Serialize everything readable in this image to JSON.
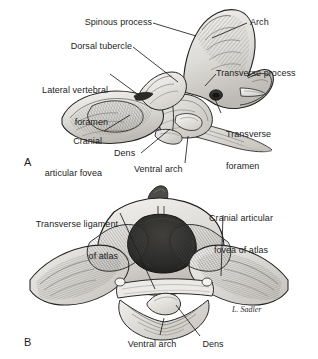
{
  "figure": {
    "background_color": "#ffffff",
    "ink_color": "#1d1d1d",
    "signature": "L. Sadler"
  },
  "panels": [
    {
      "letter": "A",
      "view": "lateral view of atlas and axis articulated",
      "labels": [
        {
          "text": "Spinous process",
          "align": "right"
        },
        {
          "text": "Dorsal tubercle",
          "align": "right"
        },
        {
          "text": "Lateral vertebral\nforamen",
          "align": "right"
        },
        {
          "text": "Cranial\narticular fovea",
          "align": "right"
        },
        {
          "text": "Dens",
          "align": "left"
        },
        {
          "text": "Ventral arch",
          "align": "left"
        },
        {
          "text": "Arch",
          "align": "left"
        },
        {
          "text": "Transverse process",
          "align": "left"
        },
        {
          "text": "Transverse\nforamen",
          "align": "left"
        }
      ]
    },
    {
      "letter": "B",
      "view": "cranial view of atlas with transverse ligament and dens",
      "labels": [
        {
          "text": "Transverse ligament\nof atlas",
          "align": "right"
        },
        {
          "text": "Cranial articular\nfovea of atlas",
          "align": "center"
        },
        {
          "text": "Ventral arch",
          "align": "center"
        },
        {
          "text": "Dens",
          "align": "center"
        }
      ]
    }
  ],
  "label_text": {
    "spinous_process": "Spinous process",
    "dorsal_tubercle": "Dorsal tubercle",
    "lateral_vertebral_foramen_l1": "Lateral vertebral",
    "lateral_vertebral_foramen_l2": "foramen",
    "cranial_articular_fovea_l1": "Cranial",
    "cranial_articular_fovea_l2": "articular fovea",
    "dens_a": "Dens",
    "ventral_arch_a": "Ventral arch",
    "arch": "Arch",
    "transverse_process": "Transverse process",
    "transverse_foramen_l1": "Transverse",
    "transverse_foramen_l2": "foramen",
    "transverse_ligament_l1": "Transverse ligament",
    "transverse_ligament_l2": "of atlas",
    "cranial_fovea_atlas_l1": "Cranial articular",
    "cranial_fovea_atlas_l2": "fovea of atlas",
    "ventral_arch_b": "Ventral arch",
    "dens_b": "Dens",
    "panel_a": "A",
    "panel_b": "B",
    "signature": "L. Sadler"
  }
}
